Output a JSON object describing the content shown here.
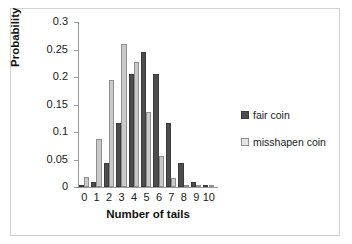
{
  "chart_data": {
    "type": "bar",
    "title": "",
    "xlabel": "Number of tails",
    "ylabel": "Probability",
    "categories": [
      "0",
      "1",
      "2",
      "3",
      "4",
      "5",
      "6",
      "7",
      "8",
      "9",
      "10"
    ],
    "series": [
      {
        "name": "fair coin",
        "color": "#4d4d4d",
        "values": [
          0.001,
          0.01,
          0.044,
          0.117,
          0.205,
          0.246,
          0.205,
          0.117,
          0.044,
          0.01,
          0.001
        ]
      },
      {
        "name": "misshapen coin",
        "color": "#c9c9c9",
        "values": [
          0.018,
          0.087,
          0.195,
          0.26,
          0.227,
          0.137,
          0.057,
          0.017,
          0.003,
          0.0,
          0.0
        ]
      }
    ],
    "ylim": [
      0,
      0.3
    ],
    "yticks": [
      "0",
      "0.05",
      "0.1",
      "0.15",
      "0.2",
      "0.25",
      "0.3"
    ],
    "ytick_values": [
      0,
      0.05,
      0.1,
      0.15,
      0.2,
      0.25,
      0.3
    ],
    "grid": false,
    "legend_position": "right"
  },
  "legend": {
    "items": [
      {
        "label": "fair coin",
        "swatch": "fair"
      },
      {
        "label": "misshapen coin",
        "swatch": "miss"
      }
    ]
  }
}
